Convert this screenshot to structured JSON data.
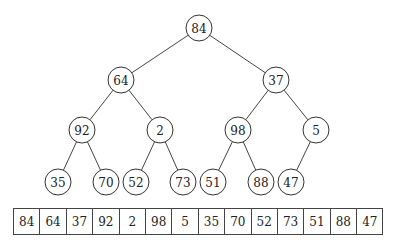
{
  "tree": {
    "radius": 13,
    "nodes": [
      {
        "id": 0,
        "value": "84",
        "x": 199,
        "y": 28
      },
      {
        "id": 1,
        "value": "64",
        "x": 121,
        "y": 80
      },
      {
        "id": 2,
        "value": "37",
        "x": 276,
        "y": 80
      },
      {
        "id": 3,
        "value": "92",
        "x": 82,
        "y": 130
      },
      {
        "id": 4,
        "value": "2",
        "x": 160,
        "y": 130
      },
      {
        "id": 5,
        "value": "98",
        "x": 238,
        "y": 130
      },
      {
        "id": 6,
        "value": "5",
        "x": 316,
        "y": 130
      },
      {
        "id": 7,
        "value": "35",
        "x": 58,
        "y": 182
      },
      {
        "id": 8,
        "value": "70",
        "x": 106,
        "y": 182
      },
      {
        "id": 9,
        "value": "52",
        "x": 136,
        "y": 182
      },
      {
        "id": 10,
        "value": "73",
        "x": 183,
        "y": 182
      },
      {
        "id": 11,
        "value": "51",
        "x": 213,
        "y": 182
      },
      {
        "id": 12,
        "value": "88",
        "x": 261,
        "y": 182
      },
      {
        "id": 13,
        "value": "47",
        "x": 291,
        "y": 182
      }
    ],
    "edges": [
      [
        0,
        1
      ],
      [
        0,
        2
      ],
      [
        1,
        3
      ],
      [
        1,
        4
      ],
      [
        2,
        5
      ],
      [
        2,
        6
      ],
      [
        3,
        7
      ],
      [
        3,
        8
      ],
      [
        4,
        9
      ],
      [
        4,
        10
      ],
      [
        5,
        11
      ],
      [
        5,
        12
      ],
      [
        6,
        13
      ]
    ]
  },
  "array": {
    "values": [
      "84",
      "64",
      "37",
      "92",
      "2",
      "98",
      "5",
      "35",
      "70",
      "52",
      "73",
      "51",
      "88",
      "47"
    ]
  }
}
